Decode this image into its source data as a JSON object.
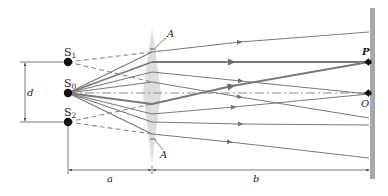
{
  "figure": {
    "labels": {
      "source_1": "S",
      "source_1_sub": "1",
      "source_0": "S",
      "source_0_sub": "0",
      "source_2": "S",
      "source_2_sub": "2",
      "apex_top": "A",
      "apex_bottom": "A",
      "point_p": "P",
      "point_o": "O",
      "dim_d": "d",
      "dim_a": "a",
      "dim_b": "b"
    },
    "colors": {
      "ray": "#7a7a7a",
      "ray_thick": "#6e6e6e",
      "dashed": "#8a8a8a",
      "prism": "#d6d6d6",
      "screen": "#a8a8a8",
      "point": "#111111",
      "dimension": "#555555"
    }
  }
}
